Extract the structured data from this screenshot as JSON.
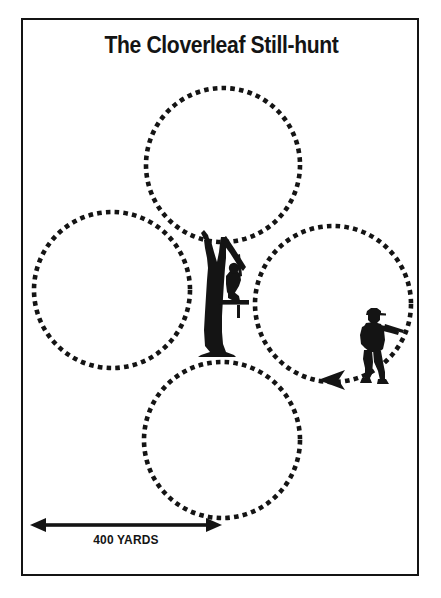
{
  "page": {
    "title": "The Cloverleaf Still-hunt",
    "background_color": "#ffffff",
    "ink_color": "#141414",
    "frame": {
      "border_color": "#141414",
      "border_width": 2
    }
  },
  "scale_bar": {
    "label": "400 YARDS",
    "arrow_style": "double-headed",
    "start_x": 30,
    "end_x": 222,
    "y": 525
  },
  "diagram": {
    "type": "hunting-pattern-map",
    "pattern_name": "cloverleaf",
    "loop_style": "dotted",
    "loop_color": "#141414",
    "loops": [
      {
        "name": "north-loop",
        "cx": 223,
        "cy": 165,
        "r": 77
      },
      {
        "name": "west-loop",
        "cx": 112,
        "cy": 290,
        "r": 78
      },
      {
        "name": "east-loop",
        "cx": 333,
        "cy": 304,
        "r": 78
      },
      {
        "name": "south-loop",
        "cx": 222,
        "cy": 440,
        "r": 78
      }
    ],
    "figures": [
      {
        "name": "tree-stand-hunter",
        "icon": "tree-stand-icon",
        "x": 222,
        "y": 296,
        "description": "Hunter seated on a platform in a forked tree at the center of the cloverleaf"
      },
      {
        "name": "walking-hunter",
        "icon": "hunter-walking-icon",
        "x": 373,
        "y": 338,
        "description": "Still-hunter walking the east loop carrying a rifle"
      }
    ],
    "direction_marker": {
      "name": "travel-direction-arrow",
      "x": 333,
      "y": 380,
      "points": "left"
    }
  }
}
